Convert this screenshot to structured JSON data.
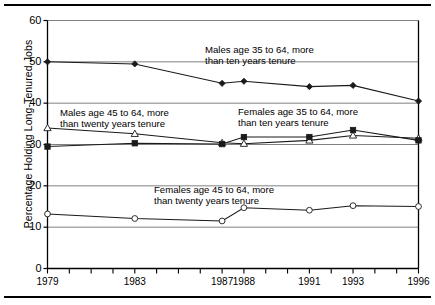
{
  "figure": {
    "ylabel": "Percentage Holding Long-Tenured Jobs",
    "frame_color": "#000000",
    "grid_color": "#808080",
    "series_color": "#1a1a1a"
  },
  "annotations": [
    {
      "id": "males-35-64",
      "line1": "Males age 35 to 64, more",
      "line2": "than ten years tenure",
      "x": 205,
      "y": 44
    },
    {
      "id": "males-45-64",
      "line1": "Males age 45 to 64, more",
      "line2": "than twenty years tenure",
      "x": 60,
      "y": 107
    },
    {
      "id": "females-35-64",
      "line1": "Females age 35 to 64, more",
      "line2": "than ten years tenure",
      "x": 238,
      "y": 106
    },
    {
      "id": "females-45-64",
      "line1": "Females age 45 to 64, more",
      "line2": "than twenty years tenure",
      "x": 154,
      "y": 184
    }
  ],
  "chart_data": {
    "type": "line",
    "title": "",
    "xlabel": "",
    "ylabel": "Percentage Holding Long-Tenured Jobs",
    "ylim": [
      0,
      60
    ],
    "yticks": [
      0,
      10,
      20,
      30,
      40,
      50,
      60
    ],
    "xlim": [
      1979,
      1996
    ],
    "xticks": [
      1979,
      1980,
      1981,
      1982,
      1983,
      1984,
      1985,
      1986,
      1987,
      1988,
      1989,
      1990,
      1991,
      1992,
      1993,
      1994,
      1995,
      1996
    ],
    "xtick_labels_shown": [
      "1979",
      "1983",
      "1987",
      "1988",
      "1991",
      "1993",
      "1996"
    ],
    "grid": true,
    "grid_orientation": "horizontal",
    "legend_position": "inline-annotations",
    "series": [
      {
        "name": "Males age 35 to 64, more than ten years tenure",
        "marker": "filled-diamond",
        "x": [
          1979,
          1983,
          1987,
          1988,
          1991,
          1993,
          1996
        ],
        "values": [
          50.0,
          49.5,
          44.8,
          45.3,
          44.0,
          44.3,
          40.5
        ]
      },
      {
        "name": "Males age 45 to 64, more than twenty years tenure",
        "marker": "open-triangle",
        "x": [
          1979,
          1983,
          1987,
          1988,
          1991,
          1993,
          1996
        ],
        "values": [
          34.0,
          32.6,
          30.4,
          30.2,
          31.0,
          32.2,
          31.5
        ]
      },
      {
        "name": "Females age 35 to 64, more than ten years tenure",
        "marker": "filled-square",
        "x": [
          1979,
          1983,
          1987,
          1988,
          1991,
          1993,
          1996
        ],
        "values": [
          29.5,
          30.3,
          30.1,
          31.8,
          31.8,
          33.5,
          31.0
        ]
      },
      {
        "name": "Females age 45 to 64, more than twenty years tenure",
        "marker": "open-circle",
        "x": [
          1979,
          1983,
          1987,
          1988,
          1991,
          1993,
          1996
        ],
        "values": [
          13.2,
          12.1,
          11.5,
          14.7,
          14.1,
          15.2,
          15.0
        ]
      }
    ]
  }
}
